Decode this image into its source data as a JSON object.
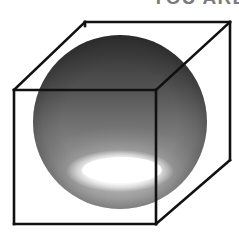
{
  "figure": {
    "background_color": "#ffffff",
    "width": 239,
    "height": 234
  },
  "caption": {
    "text": "YOU ARE",
    "note": "clipped at top edge of image, only lower pixel tips of glyphs visible",
    "color": "#7b7b7b"
  },
  "cube": {
    "label": "wireframe-cube",
    "line_color": "#111111",
    "line_width": 2.6,
    "front_face": {
      "top_left": [
        14,
        90
      ],
      "top_right": [
        156,
        90
      ],
      "bottom_right": [
        156,
        224
      ],
      "bottom_left": [
        14,
        224
      ]
    },
    "back_face": {
      "top_left": [
        85,
        22
      ],
      "top_right": [
        230,
        22
      ],
      "bottom_right": [
        230,
        160
      ],
      "bottom_left": [
        85,
        160
      ]
    },
    "visible_back_edges": [
      "top_left_to_top_right",
      "top_right_to_bottom_right"
    ],
    "connecting_edges": [
      "front_top_left_to_back_top_left",
      "front_top_right_to_back_top_right",
      "front_bottom_right_to_back_bottom_right"
    ]
  },
  "sphere": {
    "label": "shaded-sphere",
    "center": [
      120,
      122
    ],
    "radius": 87,
    "bounds": {
      "left": 33,
      "right": 207,
      "top": 38,
      "bottom": 208
    },
    "shading": {
      "top_color": "#3f3f3f",
      "upper_mid_color": "#5c5c5c",
      "mid_color": "#858585",
      "lower_mid_color": "#909090",
      "rim_color": "#8d8d8d"
    },
    "highlight": {
      "label": "specular-highlight",
      "center": [
        120,
        171
      ],
      "radius_x": 52,
      "radius_y": 19,
      "core_color": "#ffffff",
      "falloff_color": "#bdbdbd"
    }
  }
}
